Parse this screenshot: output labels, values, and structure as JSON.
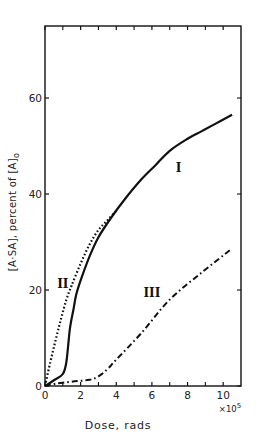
{
  "chart_data": {
    "type": "line",
    "title": "",
    "xlabel": "Dose, rads",
    "x_multiplier": "×10",
    "x_multiplier_exp": "5",
    "ylabel": "[A·SA], percent of [A]",
    "ylabel_subscript": "o",
    "xlim": [
      0,
      11
    ],
    "ylim": [
      0,
      75
    ],
    "x_ticks": [
      0,
      2,
      4,
      6,
      8,
      10
    ],
    "x_tick_labels": [
      "0",
      "2",
      "4",
      "6",
      "8",
      "10"
    ],
    "x_minor_ticks": [
      1,
      3,
      5,
      7,
      9
    ],
    "y_ticks": [
      0,
      20,
      40,
      60
    ],
    "y_tick_labels": [
      "0",
      "20",
      "40",
      "60"
    ],
    "grid": false,
    "legend": "none (inline curve labels)",
    "series": [
      {
        "name": "I",
        "style": "solid",
        "label_pos": [
          7.5,
          44.5
        ],
        "x": [
          0,
          0.5,
          1.0,
          1.2,
          1.4,
          1.6,
          1.75,
          2.0,
          2.5,
          3.0,
          3.7,
          4.5,
          5.4,
          6.2,
          7.0,
          8.0,
          8.75,
          9.5,
          10.5
        ],
        "y": [
          0,
          1.2,
          2.5,
          5,
          12,
          16,
          19,
          22,
          27,
          31,
          35,
          39,
          43,
          46,
          49,
          51.5,
          53,
          54.5,
          56.5
        ]
      },
      {
        "name": "II",
        "style": "dotted",
        "label_pos": [
          1.0,
          20.5
        ],
        "x": [
          0,
          0.3,
          0.6,
          0.9,
          1.2,
          1.5,
          2.0,
          2.5,
          3.0,
          3.5,
          4.0
        ],
        "y": [
          0,
          5,
          9.6,
          14,
          18,
          21,
          25.5,
          29.5,
          32.5,
          34.5,
          36.5
        ]
      },
      {
        "name": "III",
        "style": "dash-dot",
        "label_pos": [
          6.0,
          18.5
        ],
        "x": [
          0,
          0.6,
          1.5,
          2.5,
          3.0,
          3.5,
          4.0,
          5.4,
          7.0,
          8.75,
          10.45
        ],
        "y": [
          0,
          0.5,
          0.9,
          1.3,
          2.0,
          3.5,
          5.5,
          11,
          18,
          23.5,
          28.5
        ]
      }
    ]
  }
}
